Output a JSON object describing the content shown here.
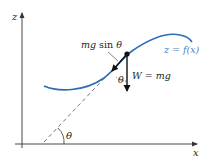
{
  "diagram": {
    "axes": {
      "z_label": "z",
      "x_label": "x"
    },
    "curve": {
      "label": "z = f(x)",
      "color": "#2a6db5"
    },
    "forces": {
      "tangential_label_italic": "mg",
      "tangential_label_rest": " sin ",
      "tangential_label_theta": "θ",
      "weight_label_w": "W",
      "weight_label_eq": " = ",
      "weight_label_mg": "mg"
    },
    "angles": {
      "base_angle": "θ",
      "force_angle": "θ"
    },
    "colors": {
      "curve": "#2a6db5",
      "ink": "#231f20",
      "dashed": "#555555",
      "axis": "#333333"
    }
  }
}
